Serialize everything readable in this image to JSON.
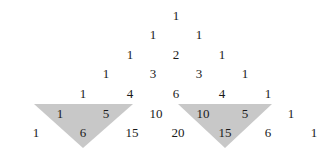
{
  "diagram": {
    "rows": [
      [
        "1"
      ],
      [
        "1",
        "1"
      ],
      [
        "1",
        "2",
        "1"
      ],
      [
        "1",
        "3",
        "3",
        "1"
      ],
      [
        "1",
        "4",
        "6",
        "4",
        "1"
      ],
      [
        "1",
        "5",
        "10",
        "10",
        "5",
        "1"
      ],
      [
        "1",
        "6",
        "15",
        "20",
        "15",
        "6",
        "1"
      ]
    ],
    "highlights": [
      {
        "name": "left-sum-triangle",
        "addends": [
          "1",
          "5"
        ],
        "sum": "6",
        "fill": "#c8c8c8"
      },
      {
        "name": "right-sum-triangle",
        "addends": [
          "10",
          "5"
        ],
        "sum": "15",
        "fill": "#c8c8c8"
      }
    ],
    "colors": {
      "background": "#ffffff",
      "text": "#1a1a1a",
      "shade": "#c8c8c8"
    }
  }
}
